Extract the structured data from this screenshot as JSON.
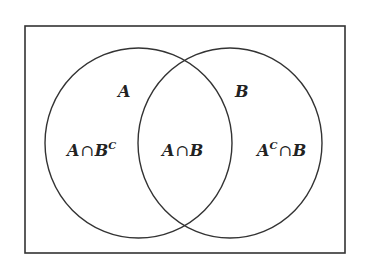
{
  "diagram": {
    "type": "venn",
    "universe": {
      "x": 25,
      "y": 26,
      "width": 320,
      "height": 227,
      "stroke": "#333333"
    },
    "sets": [
      {
        "id": "A",
        "label": "A",
        "cx": 138.5,
        "cy": 143,
        "rx": 93.5,
        "ry": 95,
        "label_x": 118,
        "label_y": 97
      },
      {
        "id": "B",
        "label": "B",
        "cx": 230,
        "cy": 143,
        "rx": 92,
        "ry": 95,
        "label_x": 235,
        "label_y": 97
      }
    ],
    "regions": [
      {
        "id": "a-only",
        "base": "A",
        "op": "∩",
        "rhs": "B",
        "sup_on": "rhs",
        "sup": "C",
        "x": 67,
        "y": 156
      },
      {
        "id": "a-and-b",
        "base": "A",
        "op": "∩",
        "rhs": "B",
        "sup_on": "",
        "sup": "",
        "x": 162,
        "y": 156
      },
      {
        "id": "b-only",
        "base": "A",
        "op": "∩",
        "rhs": "B",
        "sup_on": "base",
        "sup": "C",
        "x": 257,
        "y": 156
      }
    ],
    "line_color": "#333333",
    "text_color": "#222222"
  },
  "labels": {
    "set_a": "A",
    "set_b": "B",
    "region_a_only": {
      "base": "A",
      "op": "∩",
      "rhs": "B",
      "sup": "C"
    },
    "region_intersection": {
      "base": "A",
      "op": "∩",
      "rhs": "B"
    },
    "region_b_only": {
      "base": "A",
      "sup": "C",
      "op": "∩",
      "rhs": "B"
    }
  }
}
